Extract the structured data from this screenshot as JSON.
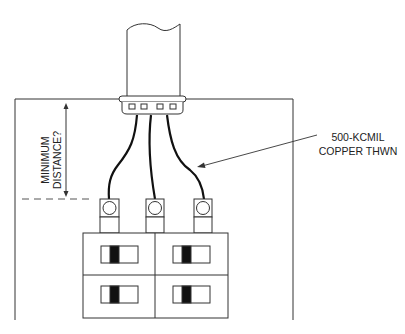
{
  "diagram": {
    "type": "electrical-panel-clearance",
    "labels": {
      "dimension_line1": "MINIMUM",
      "dimension_line2": "DISTANCE?",
      "conductor_line1": "500-KCMIL",
      "conductor_line2": "COPPER THWN"
    },
    "components": {
      "conduit": "conduit-pipe",
      "bushing": "conduit-bushing",
      "enclosure": "panel-enclosure",
      "conductors": 3,
      "terminals": 3,
      "breakers": 4
    },
    "colors": {
      "line": "#333333",
      "wire": "#111111",
      "background": "#ffffff"
    }
  }
}
